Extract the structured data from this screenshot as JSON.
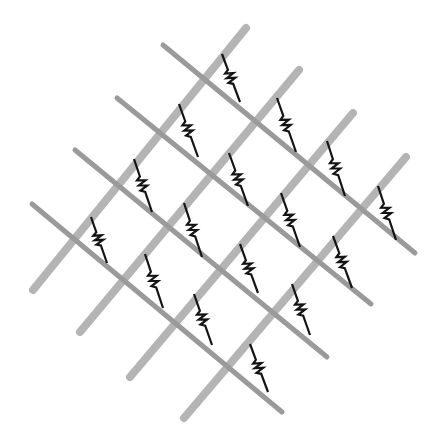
{
  "diagram": {
    "title": "",
    "colors": {
      "background": "#ffffff",
      "rising_rail": "#b4b4b4",
      "falling_rail": "#9a9a9a",
      "resistor": "#141414"
    },
    "stroke_widths": {
      "rising_rail": 8,
      "falling_rail": 5,
      "resistor": 2.2
    },
    "rising_rails": [
      {
        "id": "L1",
        "x1": 33,
        "y1": 290,
        "x2": 246,
        "y2": 28
      },
      {
        "id": "L2",
        "x1": 80,
        "y1": 332,
        "x2": 299,
        "y2": 70
      },
      {
        "id": "L3",
        "x1": 130,
        "y1": 377,
        "x2": 353,
        "y2": 113
      },
      {
        "id": "L4",
        "x1": 184,
        "y1": 418,
        "x2": 406,
        "y2": 157
      }
    ],
    "falling_rails": [
      {
        "id": "D1",
        "x1": 163,
        "y1": 45,
        "x2": 415,
        "y2": 253
      },
      {
        "id": "D2",
        "x1": 117,
        "y1": 98,
        "x2": 371,
        "y2": 304
      },
      {
        "id": "D3",
        "x1": 75,
        "y1": 150,
        "x2": 327,
        "y2": 357
      },
      {
        "id": "D4",
        "x1": 32,
        "y1": 204,
        "x2": 282,
        "y2": 412
      }
    ],
    "resistors": [
      {
        "id": "R1",
        "from": "L1",
        "to": "D1",
        "x1": 222,
        "y1": 54,
        "x2": 240,
        "y2": 102
      },
      {
        "id": "R2",
        "from": "L1",
        "to": "D2",
        "x1": 179,
        "y1": 104,
        "x2": 198,
        "y2": 157
      },
      {
        "id": "R3",
        "from": "L1",
        "to": "D3",
        "x1": 134,
        "y1": 159,
        "x2": 152,
        "y2": 212
      },
      {
        "id": "R4",
        "from": "L1",
        "to": "D4",
        "x1": 91,
        "y1": 217,
        "x2": 107,
        "y2": 263
      },
      {
        "id": "R5",
        "from": "L2",
        "to": "D1",
        "x1": 277,
        "y1": 98,
        "x2": 296,
        "y2": 152
      },
      {
        "id": "R6",
        "from": "L2",
        "to": "D2",
        "x1": 229,
        "y1": 153,
        "x2": 248,
        "y2": 206
      },
      {
        "id": "R7",
        "from": "L2",
        "to": "D3",
        "x1": 184,
        "y1": 203,
        "x2": 202,
        "y2": 257
      },
      {
        "id": "R8",
        "from": "L2",
        "to": "D4",
        "x1": 145,
        "y1": 254,
        "x2": 163,
        "y2": 308
      },
      {
        "id": "R9",
        "from": "L3",
        "to": "D1",
        "x1": 327,
        "y1": 141,
        "x2": 345,
        "y2": 196
      },
      {
        "id": "R10",
        "from": "L3",
        "to": "D2",
        "x1": 281,
        "y1": 193,
        "x2": 300,
        "y2": 247
      },
      {
        "id": "R11",
        "from": "L3",
        "to": "D3",
        "x1": 240,
        "y1": 244,
        "x2": 258,
        "y2": 293
      },
      {
        "id": "R12",
        "from": "L3",
        "to": "D4",
        "x1": 194,
        "y1": 294,
        "x2": 212,
        "y2": 345
      },
      {
        "id": "R13",
        "from": "L4",
        "to": "D1",
        "x1": 378,
        "y1": 186,
        "x2": 396,
        "y2": 240
      },
      {
        "id": "R14",
        "from": "L4",
        "to": "D2",
        "x1": 333,
        "y1": 236,
        "x2": 352,
        "y2": 288
      },
      {
        "id": "R15",
        "from": "L4",
        "to": "D3",
        "x1": 292,
        "y1": 284,
        "x2": 310,
        "y2": 335
      },
      {
        "id": "R16",
        "from": "L4",
        "to": "D4",
        "x1": 250,
        "y1": 344,
        "x2": 268,
        "y2": 392
      }
    ]
  }
}
